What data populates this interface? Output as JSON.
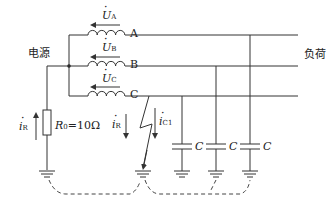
{
  "source_label": "电源",
  "load_label": "负荷",
  "phases": [
    {
      "name": "A",
      "voltage_symbol": "U",
      "voltage_sub": "A"
    },
    {
      "name": "B",
      "voltage_symbol": "U",
      "voltage_sub": "B"
    },
    {
      "name": "C",
      "voltage_symbol": "U",
      "voltage_sub": "C"
    }
  ],
  "resistor": {
    "symbol": "R",
    "sub": "0",
    "value": "=10Ω"
  },
  "currents": {
    "ir_left": {
      "symbol": "i",
      "sub": "R"
    },
    "ir_fault": {
      "symbol": "i",
      "sub": "R"
    },
    "ic1": {
      "symbol": "i",
      "sub": "C1"
    }
  },
  "capacitors": [
    {
      "label": "C"
    },
    {
      "label": "C"
    },
    {
      "label": "C"
    }
  ],
  "colors": {
    "line": "#333333",
    "background": "#ffffff"
  }
}
